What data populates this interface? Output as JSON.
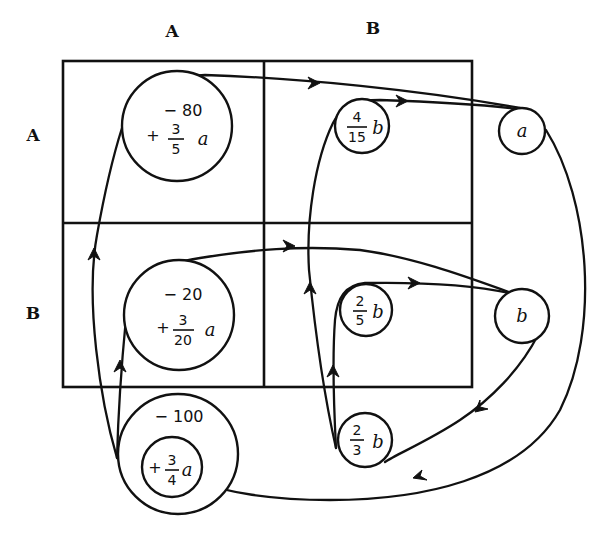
{
  "columns": {
    "A": "A",
    "B": "B"
  },
  "rows": {
    "A": "A",
    "B": "B"
  },
  "nodes": {
    "cell_AA": {
      "constant": "− 80",
      "sign": "+",
      "numerator": "3",
      "denominator": "5",
      "variable": "a"
    },
    "cell_AB": {
      "numerator": "4",
      "denominator": "15",
      "variable": "b"
    },
    "node_a": {
      "variable": "a"
    },
    "cell_BA": {
      "constant": "− 20",
      "sign": "+",
      "numerator": "3",
      "denominator": "20",
      "variable": "a"
    },
    "cell_BB": {
      "numerator": "2",
      "denominator": "5",
      "variable": "b"
    },
    "node_b": {
      "variable": "b"
    },
    "total_A": {
      "constant": "− 100",
      "sign": "+",
      "numerator": "3",
      "denominator": "4",
      "variable": "a"
    },
    "total_B": {
      "numerator": "2",
      "denominator": "3",
      "variable": "b"
    }
  },
  "colors": {
    "ink": "#111111",
    "background": "#ffffff"
  }
}
